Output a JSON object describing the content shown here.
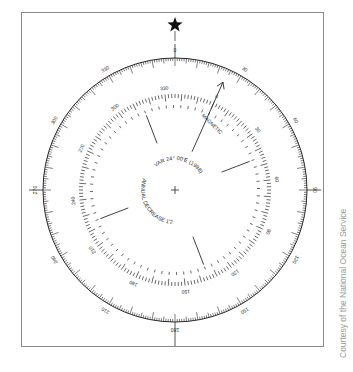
{
  "figure": {
    "credit": "Courtesy of the National Ocean Service",
    "north_marker": "star",
    "center": [
      175,
      190
    ],
    "outer_ring": {
      "name": "true",
      "radius": 132,
      "labels_every_deg": 30,
      "labels": [
        "0",
        "30",
        "60",
        "90",
        "120",
        "150",
        "180",
        "210",
        "240",
        "270",
        "300",
        "330"
      ]
    },
    "inner_ring": {
      "name": "magnetic",
      "radius": 96,
      "rotation_deg": 24,
      "labels_every_deg": 30,
      "labels": [
        "0",
        "30",
        "60",
        "90",
        "120",
        "150",
        "180",
        "210",
        "240",
        "270",
        "300",
        "330"
      ],
      "arrow_label": "MAGNETIC"
    },
    "variation_text": "VAR 24° 00'E (1998)",
    "annual_change_text": "ANNUAL DECREASE 1'2",
    "colors": {
      "ink": "#2a2a2a",
      "frame": "#8a8a8a",
      "credit": "#9a9a9a"
    }
  }
}
